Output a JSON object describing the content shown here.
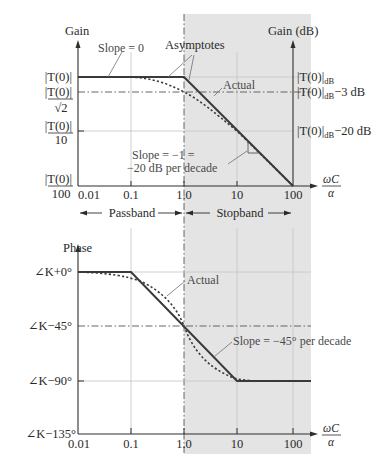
{
  "colors": {
    "stopband_shade": "#e4e4e4",
    "curve": "#3a3a3a",
    "grid": "#c4c4c4",
    "text": "#2a2a2a"
  },
  "gain_plot": {
    "y_axis_label": "Gain",
    "right_axis_label": "Gain (dB)",
    "y_ticks": [
      {
        "label_num": "|T(0)|",
        "label_den": ""
      },
      {
        "label_num": "|T(0)|",
        "label_den": "√2"
      },
      {
        "label_num": "|T(0)|",
        "label_den": "10"
      },
      {
        "label_num": "|T(0)|",
        "label_den": "100"
      }
    ],
    "right_ticks": [
      {
        "main": "|T(0)|",
        "sub": "dB",
        "suffix": ""
      },
      {
        "main": "|T(0)|",
        "sub": "dB",
        "suffix": "−3 dB"
      },
      {
        "main": "|T(0)|",
        "sub": "dB",
        "suffix": "−20 dB"
      }
    ],
    "x_ticks": [
      "0.01",
      "0.1",
      "1.0",
      "10",
      "100"
    ],
    "x_axis_label_num": "ωC",
    "x_axis_label_den": "α",
    "annotations": {
      "slope0": "Slope = 0",
      "asymptotes": "Asymptotes",
      "actual": "Actual",
      "slope_neg1_line1": "Slope = −1 =",
      "slope_neg1_line2": "−20 dB per decade"
    }
  },
  "bands": {
    "passband": "Passband",
    "stopband": "Stopband"
  },
  "phase_plot": {
    "y_axis_label": "Phase",
    "y_ticks": [
      "∠K+0°",
      "∠K−45°",
      "∠K−90°",
      "∠K−135°"
    ],
    "x_ticks": [
      "0.01",
      "0.1",
      "1.0",
      "10",
      "100"
    ],
    "x_axis_label_num": "ωC",
    "x_axis_label_den": "α",
    "annotations": {
      "actual": "Actual",
      "slope": "Slope = −45° per decade"
    }
  }
}
